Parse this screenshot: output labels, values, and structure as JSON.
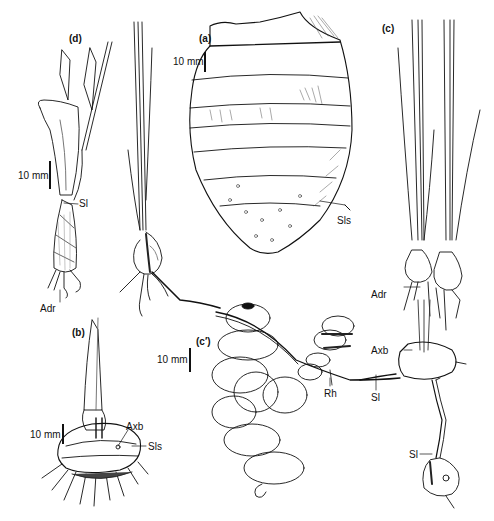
{
  "figure": {
    "panels": [
      {
        "id": "a",
        "label": "(a)",
        "scale": "10 mm",
        "parts": [
          "Sls"
        ]
      },
      {
        "id": "b",
        "label": "(b)",
        "scale": "10 mm",
        "parts": [
          "Axb",
          "Sls"
        ]
      },
      {
        "id": "c",
        "label": "(c)",
        "parts": [
          "Adr",
          "Axb",
          "Sl",
          "Sl"
        ]
      },
      {
        "id": "c_prime",
        "label": "(c')",
        "scale": "10 mm",
        "parts": [
          "Rh"
        ]
      },
      {
        "id": "d",
        "label": "(d)",
        "scale": "10 mm",
        "parts": [
          "Sl",
          "Adr"
        ]
      }
    ],
    "labels": {
      "panel_a": "(a)",
      "panel_b": "(b)",
      "panel_c": "(c)",
      "panel_c_prime": "(c′)",
      "panel_d": "(d)",
      "scale_a": "10 mm",
      "scale_b": "10 mm",
      "scale_c_prime": "10 mm",
      "scale_d": "10 mm",
      "a_sls": "Sls",
      "b_axb": "Axb",
      "b_sls": "Sls",
      "c_adr": "Adr",
      "c_axb": "Axb",
      "c_sl_rhizome": "Sl",
      "c_sl_lower": "Sl",
      "c_prime_rh": "Rh",
      "d_sl": "Sl",
      "d_adr": "Adr"
    },
    "colors": {
      "ink": "#111111",
      "background": "#ffffff",
      "shade": "#555555"
    }
  }
}
